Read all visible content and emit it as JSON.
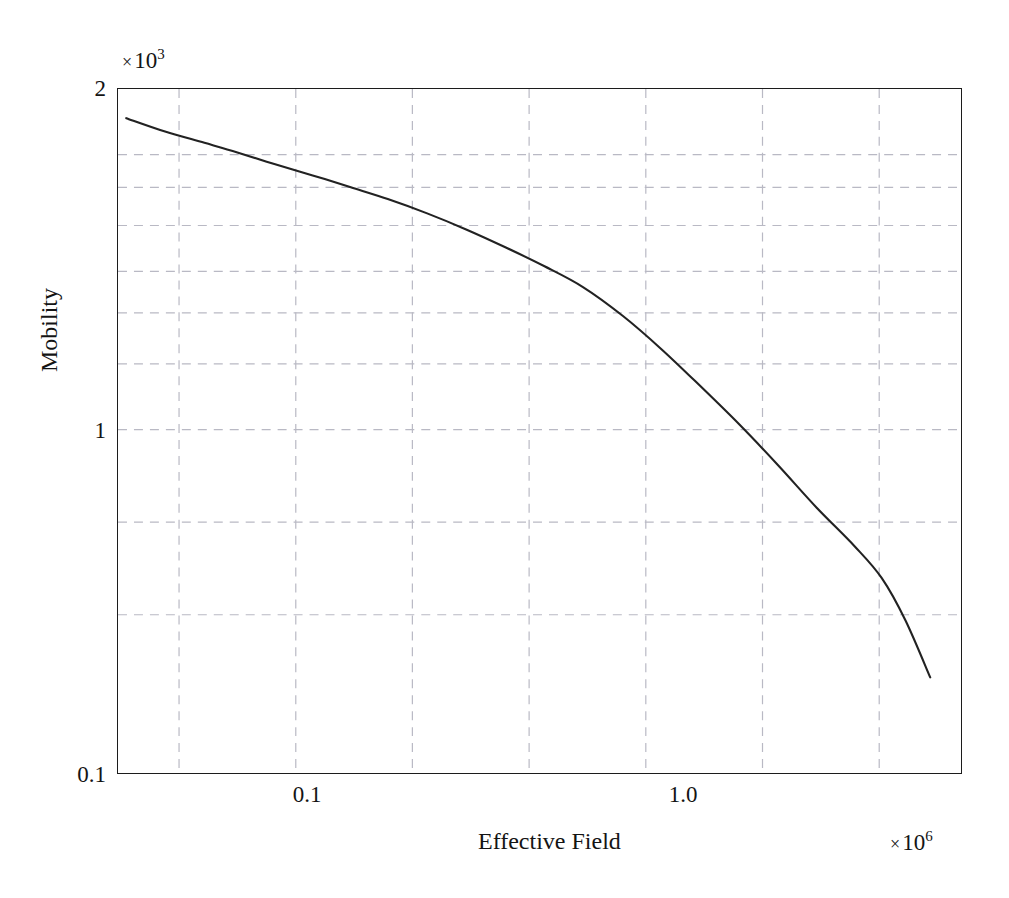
{
  "chart_data": {
    "type": "line",
    "title": "",
    "xlabel": "Effective Field",
    "ylabel": "Mobility",
    "x_multiplier_times": "×",
    "x_multiplier_base": "10",
    "x_multiplier_exp": "6",
    "y_multiplier_times": "×",
    "y_multiplier_base": "10",
    "y_multiplier_exp": "3",
    "xscale": "log",
    "yscale": "log",
    "xlim": [
      0.0555,
      3.55
    ],
    "ylim": [
      100,
      2000
    ],
    "grid": true,
    "grid_style": "dashed",
    "legend": "none",
    "xticks": [
      0.1,
      1.0
    ],
    "xtick_labels": [
      "0.1",
      "1.0"
    ],
    "yticks": [
      2000,
      1000,
      100
    ],
    "ytick_labels": [
      "2",
      "1",
      "0.1"
    ],
    "x_gridlines": [
      0.075,
      0.1334,
      0.2371,
      0.4217,
      0.7499,
      1.3335,
      2.3714,
      4.217
    ],
    "y_gridlines": [
      1500,
      1300,
      1100,
      900,
      750,
      600,
      450,
      300,
      200
    ],
    "series": [
      {
        "name": "mobility-vs-effective-field",
        "x": [
          0.0578,
          0.07,
          0.085,
          0.1,
          0.12,
          0.145,
          0.175,
          0.21,
          0.255,
          0.31,
          0.375,
          0.455,
          0.55,
          0.67,
          0.81,
          0.98,
          1.19,
          1.44,
          1.74,
          2.1,
          2.4,
          2.7,
          3.05
        ],
        "y": [
          1760,
          1660,
          1580,
          1515,
          1440,
          1370,
          1300,
          1235,
          1160,
          1080,
          1000,
          920,
          840,
          740,
          640,
          545,
          460,
          385,
          320,
          270,
          235,
          195,
          152
        ]
      }
    ]
  },
  "axes": {
    "y_tick_top": "2",
    "y_tick_mid": "1",
    "y_tick_bottom": "0.1",
    "x_tick_left": "0.1",
    "x_tick_right": "1.0",
    "y_title": "Mobility",
    "x_title": "Effective Field"
  },
  "colors": {
    "curve": "#222222",
    "frame": "#1c1c1c",
    "grid": "#b9b9c4",
    "background": "#ffffff",
    "text": "#141414"
  }
}
